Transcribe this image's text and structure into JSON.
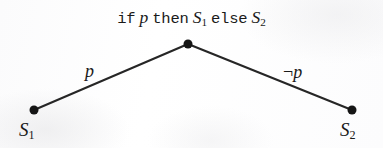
{
  "figure": {
    "type": "binary-decision-tree",
    "background_color": "#fdfdfd",
    "ink_color": "#1f1f1f",
    "width": 383,
    "height": 148
  },
  "caption": {
    "full_text": "if p then S1 else S2",
    "kw_if": "if",
    "kw_then": "then",
    "kw_else": "else",
    "condition": "p",
    "then_branch_base": "S",
    "then_branch_sub": "1",
    "else_branch_base": "S",
    "else_branch_sub": "2"
  },
  "nodes": [
    {
      "id": "root",
      "name": "decision-node",
      "x": 188,
      "y": 44,
      "radius": 4.5,
      "color": "#151515",
      "label": ""
    },
    {
      "id": "leaf-left",
      "name": "leaf-node-s1",
      "x": 34,
      "y": 110,
      "radius": 4.5,
      "color": "#151515",
      "label_base": "S",
      "label_sub": "1"
    },
    {
      "id": "leaf-right",
      "name": "leaf-node-s2",
      "x": 352,
      "y": 110,
      "radius": 4.5,
      "color": "#151515",
      "label_base": "S",
      "label_sub": "2"
    }
  ],
  "edges": [
    {
      "id": "edge-true",
      "name": "edge-root-to-s1",
      "from": "root",
      "to": "leaf-left",
      "x1": 188,
      "y1": 44,
      "x2": 34,
      "y2": 110,
      "stroke_width": 2.1,
      "color": "#262626",
      "label": "p"
    },
    {
      "id": "edge-false",
      "name": "edge-root-to-s2",
      "from": "root",
      "to": "leaf-right",
      "x1": 188,
      "y1": 44,
      "x2": 352,
      "y2": 110,
      "stroke_width": 2.1,
      "color": "#262626",
      "label_negation": "¬",
      "label_var": "p",
      "label": "¬p"
    }
  ]
}
